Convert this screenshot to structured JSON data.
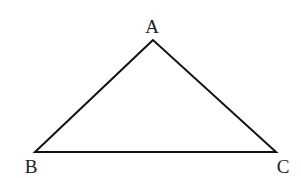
{
  "diagram": {
    "type": "triangle",
    "stroke_color": "#111111",
    "label_color": "#222222",
    "background": "#ffffff",
    "vertices": [
      {
        "label": "A",
        "x": 153,
        "y": 40,
        "label_x": 152,
        "label_y": 33
      },
      {
        "label": "B",
        "x": 35,
        "y": 152,
        "label_x": 31,
        "label_y": 173
      },
      {
        "label": "C",
        "x": 276,
        "y": 152,
        "label_x": 283,
        "label_y": 173
      }
    ],
    "edges": [
      {
        "from": "A",
        "to": "B"
      },
      {
        "from": "B",
        "to": "C"
      },
      {
        "from": "C",
        "to": "A"
      }
    ]
  }
}
